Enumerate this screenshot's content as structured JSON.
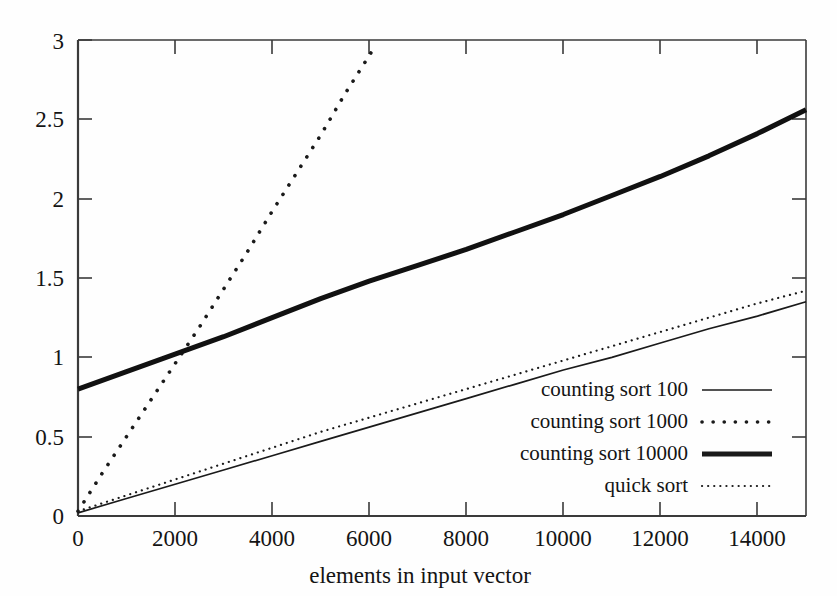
{
  "chart_data": {
    "type": "line",
    "title": "",
    "xlabel": "elements in input vector",
    "ylabel": "",
    "xlim": [
      0,
      15000
    ],
    "ylim": [
      0,
      3
    ],
    "xticks": [
      0,
      2000,
      4000,
      6000,
      8000,
      10000,
      12000,
      14000
    ],
    "xtick_labels": [
      "0",
      "2000",
      "4000",
      "6000",
      "8000",
      "10000",
      "12000",
      "14000"
    ],
    "yticks": [
      0,
      0.5,
      1,
      1.5,
      2,
      2.5,
      3
    ],
    "ytick_labels": [
      "0",
      "0.5",
      "1",
      "1.5",
      "2",
      "2.5",
      "3"
    ],
    "grid": false,
    "legend_position": "lower right",
    "series": [
      {
        "name": "counting sort 100",
        "style": "thin-solid",
        "color": "#1a1a1a",
        "x": [
          0,
          1000,
          2000,
          3000,
          4000,
          5000,
          6000,
          7000,
          8000,
          9000,
          10000,
          11000,
          12000,
          13000,
          14000,
          15000
        ],
        "y": [
          0.02,
          0.11,
          0.2,
          0.29,
          0.38,
          0.47,
          0.56,
          0.65,
          0.74,
          0.83,
          0.92,
          1.0,
          1.09,
          1.18,
          1.26,
          1.35
        ]
      },
      {
        "name": "counting sort 1000",
        "style": "coarse-dotted",
        "color": "#1a1a1a",
        "x": [
          0,
          500,
          1000,
          1500,
          2000,
          2500,
          3000,
          3500,
          4000,
          4500,
          5000,
          5500,
          6100
        ],
        "y": [
          0.03,
          0.27,
          0.5,
          0.73,
          0.96,
          1.19,
          1.43,
          1.67,
          1.92,
          2.16,
          2.4,
          2.66,
          2.95
        ]
      },
      {
        "name": "counting sort 10000",
        "style": "thick-solid",
        "color": "#111111",
        "x": [
          0,
          1000,
          2000,
          3000,
          4000,
          5000,
          6000,
          7000,
          8000,
          9000,
          10000,
          11000,
          12000,
          13000,
          14000,
          15000
        ],
        "y": [
          0.8,
          0.91,
          1.02,
          1.13,
          1.25,
          1.37,
          1.48,
          1.58,
          1.68,
          1.79,
          1.9,
          2.02,
          2.14,
          2.27,
          2.41,
          2.56
        ]
      },
      {
        "name": "quick sort",
        "style": "fine-dotted",
        "color": "#1a1a1a",
        "x": [
          0,
          1000,
          2000,
          3000,
          4000,
          5000,
          6000,
          7000,
          8000,
          9000,
          10000,
          11000,
          12000,
          13000,
          14000,
          15000
        ],
        "y": [
          0.03,
          0.13,
          0.23,
          0.33,
          0.43,
          0.53,
          0.62,
          0.71,
          0.8,
          0.89,
          0.98,
          1.07,
          1.16,
          1.25,
          1.34,
          1.42
        ]
      }
    ],
    "legend_entries": [
      {
        "label": "counting sort 100",
        "style": "thin-solid"
      },
      {
        "label": "counting sort 1000",
        "style": "coarse-dotted"
      },
      {
        "label": "counting sort 10000",
        "style": "thick-solid"
      },
      {
        "label": "quick sort",
        "style": "fine-dotted"
      }
    ],
    "colors": {
      "axis": "#3a3a3a",
      "text": "#141414",
      "background": "#fefefe",
      "series": "#1a1a1a"
    }
  }
}
